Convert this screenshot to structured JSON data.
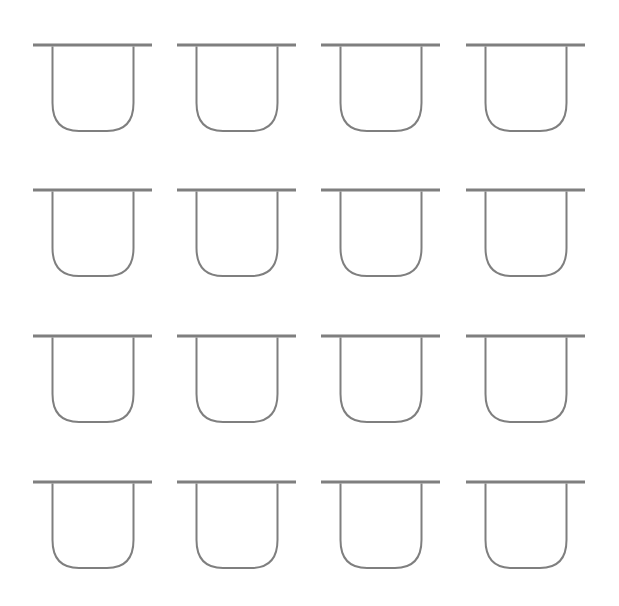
{
  "diagram": {
    "rows": 4,
    "columns": 4,
    "stroke_color": "#7f7f7f",
    "background": "#ffffff",
    "shape": "cup-with-lid",
    "col_x": [
      33,
      177,
      321,
      466
    ],
    "row_y": [
      45,
      190,
      336,
      482
    ],
    "cells": [
      {
        "row": 0,
        "col": 0
      },
      {
        "row": 0,
        "col": 1
      },
      {
        "row": 0,
        "col": 2
      },
      {
        "row": 0,
        "col": 3
      },
      {
        "row": 1,
        "col": 0
      },
      {
        "row": 1,
        "col": 1
      },
      {
        "row": 1,
        "col": 2
      },
      {
        "row": 1,
        "col": 3
      },
      {
        "row": 2,
        "col": 0
      },
      {
        "row": 2,
        "col": 1
      },
      {
        "row": 2,
        "col": 2
      },
      {
        "row": 2,
        "col": 3
      },
      {
        "row": 3,
        "col": 0
      },
      {
        "row": 3,
        "col": 1
      },
      {
        "row": 3,
        "col": 2
      },
      {
        "row": 3,
        "col": 3
      }
    ]
  }
}
